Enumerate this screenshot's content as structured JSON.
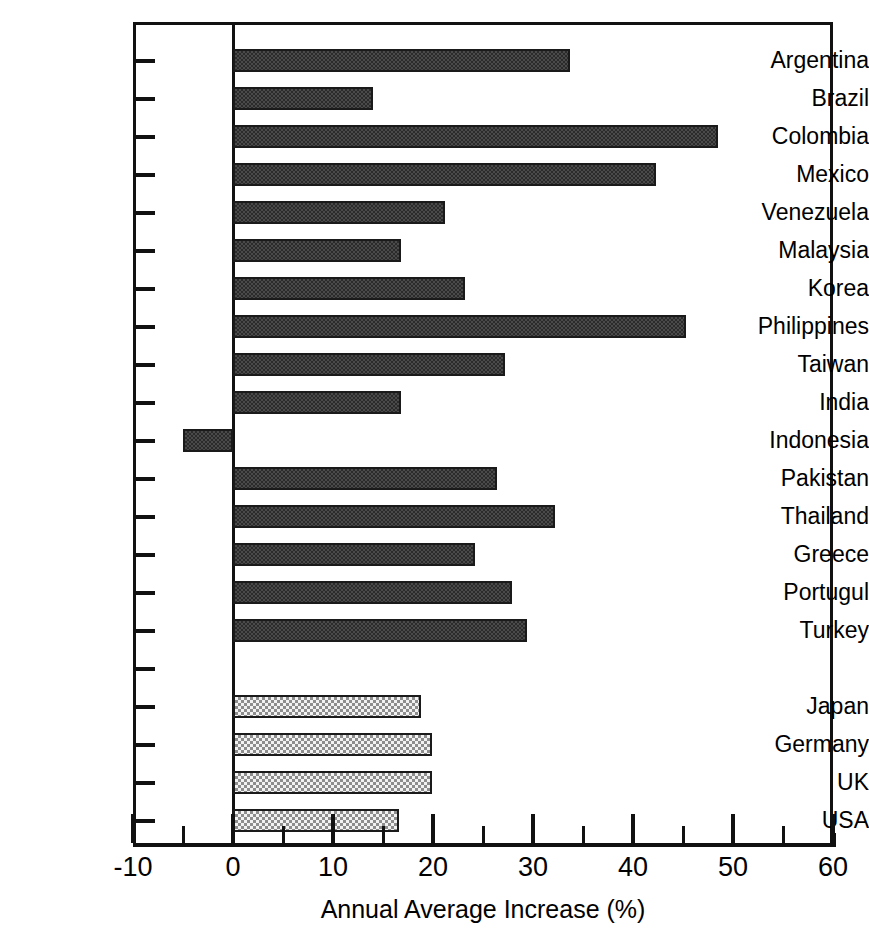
{
  "chart_data": {
    "type": "bar",
    "orientation": "horizontal",
    "title": "",
    "subtitle": "",
    "xlabel": "Annual Average Increase (%)",
    "ylabel": "",
    "xlim": [
      -10,
      60
    ],
    "ylim": null,
    "grid": false,
    "legend": null,
    "xticks": [
      -10,
      0,
      10,
      20,
      30,
      40,
      50,
      60
    ],
    "xticklabels": [
      "-10",
      "0",
      "10",
      "20",
      "30",
      "40",
      "50",
      "60"
    ],
    "xminorticks": [
      -5,
      5,
      15,
      25,
      35,
      45,
      55
    ],
    "categories": [
      "Argentina",
      "Brazil",
      "Colombia",
      "Mexico",
      "Venezuela",
      "Malaysia",
      "Korea",
      "Philippines",
      "Taiwan",
      "India",
      "Indonesia",
      "Pakistan",
      "Thailand",
      "Greece",
      "Portugul",
      "Turkey",
      "",
      "Japan",
      "Germany",
      "UK",
      "USA"
    ],
    "values": [
      33.7,
      14.0,
      48.5,
      42.3,
      21.2,
      16.8,
      23.2,
      45.3,
      27.2,
      16.8,
      -5.0,
      26.4,
      32.2,
      24.2,
      27.9,
      29.4,
      null,
      18.8,
      19.9,
      19.9,
      16.6
    ],
    "groups": [
      "developing",
      "developing",
      "developing",
      "developing",
      "developing",
      "developing",
      "developing",
      "developing",
      "developing",
      "developing",
      "developing",
      "developing",
      "developing",
      "developing",
      "developing",
      "developing",
      "spacer",
      "industrial",
      "industrial",
      "industrial",
      "industrial"
    ],
    "colors": {
      "developing_fill": "#4a4a4a",
      "developing_pattern": "#2b2b2b",
      "industrial_fill": "#f2f2f2",
      "industrial_pattern": "#8d8d8d",
      "axis": "#111111",
      "text": "#000000",
      "background": "#ffffff"
    }
  }
}
